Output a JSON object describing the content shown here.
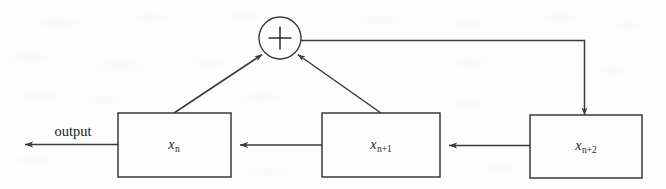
{
  "diagram": {
    "type": "block-diagram",
    "canvas": {
      "width": 666,
      "height": 189
    },
    "colors": {
      "stroke": "#3a3a3f",
      "background": "#fdfdfd",
      "text": "#1c1c1c"
    },
    "adder": {
      "symbol": "+",
      "name": "summing-junction",
      "cx": 280,
      "cy": 38,
      "r": 21
    },
    "blocks": [
      {
        "id": "x_n",
        "base": "x",
        "subscript": "n",
        "x": 118,
        "y": 113,
        "width": 113,
        "height": 64
      },
      {
        "id": "x_n_plus_1",
        "base": "x",
        "subscript": "n+1",
        "x": 322,
        "y": 113,
        "width": 118,
        "height": 64
      },
      {
        "id": "x_n_plus_2",
        "base": "x",
        "subscript": "n+2",
        "x": 530,
        "y": 115,
        "width": 112,
        "height": 63
      }
    ],
    "output": {
      "label": "output",
      "label_x": 73,
      "label_y": 131,
      "arrow_tip_x": 25,
      "arrow_y": 145
    },
    "connections": [
      {
        "name": "xn2-to-xn1",
        "kind": "horizontal-arrow",
        "from": "x_n_plus_2",
        "to": "x_n_plus_1"
      },
      {
        "name": "xn1-to-xn",
        "kind": "horizontal-arrow",
        "from": "x_n_plus_1",
        "to": "x_n"
      },
      {
        "name": "xn-to-output",
        "kind": "horizontal-arrow",
        "from": "x_n",
        "to": "output"
      },
      {
        "name": "xn-to-adder",
        "kind": "diagonal-arrow",
        "from": "x_n",
        "to": "summing-junction"
      },
      {
        "name": "xn1-to-adder",
        "kind": "diagonal-arrow",
        "from": "x_n_plus_1",
        "to": "summing-junction"
      },
      {
        "name": "adder-to-xn2",
        "kind": "feedback-path",
        "from": "summing-junction",
        "to": "x_n_plus_2"
      }
    ]
  }
}
